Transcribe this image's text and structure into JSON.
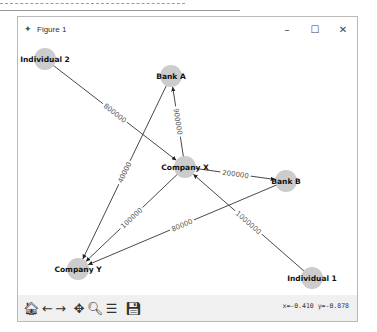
{
  "window": {
    "title": "Figure 1",
    "controls": {
      "minimize": "–",
      "maximize": "☐",
      "close": "✕"
    }
  },
  "toolbar": {
    "buttons": [
      {
        "name": "home",
        "glyph": "🏠︎",
        "icon": "home-icon"
      },
      {
        "name": "back",
        "glyph": "←",
        "icon": "arrow-left-icon"
      },
      {
        "name": "forward",
        "glyph": "→",
        "icon": "arrow-right-icon"
      },
      {
        "name": "pan",
        "glyph": "✥",
        "icon": "move-icon"
      },
      {
        "name": "zoom",
        "glyph": "🔍︎",
        "icon": "magnifier-icon"
      },
      {
        "name": "configure",
        "glyph": "☰",
        "icon": "sliders-icon"
      },
      {
        "name": "save",
        "glyph": "💾︎",
        "icon": "save-icon"
      }
    ],
    "coordinates": "x=-0.410 y=-0.878"
  },
  "graph": {
    "node_color": "#cccccc",
    "edge_color": "#333333",
    "nodes": [
      {
        "id": "Individual 2",
        "x": 27,
        "y": 18
      },
      {
        "id": "Bank A",
        "x": 153,
        "y": 35
      },
      {
        "id": "Company X",
        "x": 167,
        "y": 126
      },
      {
        "id": "Bank B",
        "x": 268,
        "y": 140
      },
      {
        "id": "Company Y",
        "x": 60,
        "y": 228
      },
      {
        "id": "Individual 1",
        "x": 294,
        "y": 237
      }
    ],
    "edges": [
      {
        "from": "Individual 2",
        "to": "Company X",
        "label": "800000"
      },
      {
        "from": "Company X",
        "to": "Bank A",
        "label": "900000"
      },
      {
        "from": "Company X",
        "to": "Bank B",
        "label": "200000"
      },
      {
        "from": "Bank A",
        "to": "Company Y",
        "label": "40000"
      },
      {
        "from": "Company X",
        "to": "Company Y",
        "label": "100000"
      },
      {
        "from": "Bank B",
        "to": "Company Y",
        "label": "80000"
      },
      {
        "from": "Individual 1",
        "to": "Company X",
        "label": "1000000"
      }
    ]
  }
}
